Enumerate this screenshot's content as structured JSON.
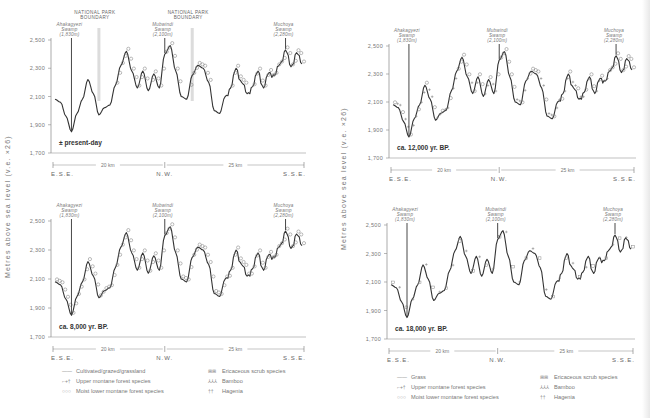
{
  "figure": {
    "y_axis_label": "Metres above sea level (v.e. ×26)",
    "y_ticks": [
      "2,500",
      "2,300",
      "2,100",
      "1,900",
      "1,700"
    ],
    "y_tick_values": [
      2500,
      2300,
      2100,
      1900,
      1700
    ],
    "direction_labels": {
      "start": "E.S.E.",
      "middle": "N.W.",
      "end": "S.S.E."
    },
    "distance_labels": {
      "first": "20 km",
      "second": "25 km"
    },
    "annotations": {
      "swamp1": [
        "Ahakagyezi",
        "Swamp",
        "(1,830m)"
      ],
      "swamp2": [
        "Mubwindi",
        "Swamp",
        "(2,100m)"
      ],
      "swamp3": [
        "Muchoya",
        "Swamp",
        "(2,280m)"
      ],
      "boundary": [
        "NATIONAL PARK",
        "BOUNDARY"
      ]
    },
    "legend_left": {
      "col1": [
        {
          "symbol": "——",
          "label": "Cultivated/grazed/grassland"
        },
        {
          "symbol": "⌐+†",
          "label": "Upper montane forest species"
        },
        {
          "symbol": "○○○",
          "label": "Moist lower montane forest species"
        }
      ],
      "col2": [
        {
          "symbol": "⊞⊞",
          "label": "Ericaceous scrub species"
        },
        {
          "symbol": "⅄⅄⅄",
          "label": "Bamboo"
        },
        {
          "symbol": "††",
          "label": "Hagenia"
        }
      ]
    },
    "legend_right": {
      "col1": [
        {
          "symbol": "——",
          "label": "Grass"
        },
        {
          "symbol": "⌐+†",
          "label": "Upper montane forest species"
        },
        {
          "symbol": "○○○",
          "label": "Moist lower montane forest species"
        }
      ],
      "col2": [
        {
          "symbol": "⊞⊞",
          "label": "Ericaceous scrub species"
        },
        {
          "symbol": "⅄⅄⅄",
          "label": "Bamboo"
        },
        {
          "symbol": "††",
          "label": "Hagenia"
        }
      ]
    }
  },
  "chart_data": [
    {
      "type": "line",
      "title": "± present-day",
      "xlabel": "Distance along transect (E.S.E. – N.W. – S.S.E.)",
      "ylabel": "Metres above sea level (v.e. ×26)",
      "ylim": [
        1700,
        2500
      ],
      "grid": false,
      "has_park_boundaries": true,
      "vegetation_symbols": "circles (moist lower montane forest) over upper slopes within park",
      "x_km": [
        0,
        1,
        2,
        3,
        4,
        5,
        6,
        7,
        8,
        9,
        10,
        11,
        12,
        13,
        14,
        15,
        16,
        17,
        18,
        19,
        20,
        21,
        22,
        23,
        24,
        25,
        26,
        27,
        28,
        29,
        30,
        31,
        32,
        33,
        34,
        35,
        36,
        37,
        38,
        39,
        40,
        41,
        42,
        43,
        44,
        45
      ],
      "elevation_m": [
        2080,
        2060,
        1960,
        1850,
        1980,
        2080,
        2220,
        2120,
        1970,
        2020,
        2040,
        2180,
        2320,
        2420,
        2280,
        2160,
        2280,
        2140,
        2260,
        2160,
        2400,
        2460,
        2280,
        2100,
        2080,
        2250,
        2320,
        2300,
        2200,
        2000,
        1980,
        2100,
        2160,
        2300,
        2200,
        2120,
        2170,
        2280,
        2160,
        2270,
        2250,
        2330,
        2430,
        2310,
        2410,
        2330
      ],
      "markers": [
        {
          "label": "Ahakagyezi Swamp (1,830m)",
          "x_km": 3
        },
        {
          "label": "Mubwindi Swamp (2,100m)",
          "x_km": 20
        },
        {
          "label": "Muchoya Swamp (2,280m)",
          "x_km": 42
        },
        {
          "label": "NATIONAL PARK BOUNDARY",
          "x_km": 8
        },
        {
          "label": "NATIONAL PARK BOUNDARY",
          "x_km": 25
        }
      ]
    },
    {
      "type": "line",
      "title": "ca. 12,000 yr. BP.",
      "ylim": [
        1700,
        2500
      ],
      "vegetation_symbols": "mixed upper montane (+) and moist lower montane (○) forest across profile",
      "x_km": [
        0,
        1,
        2,
        3,
        4,
        5,
        6,
        7,
        8,
        9,
        10,
        11,
        12,
        13,
        14,
        15,
        16,
        17,
        18,
        19,
        20,
        21,
        22,
        23,
        24,
        25,
        26,
        27,
        28,
        29,
        30,
        31,
        32,
        33,
        34,
        35,
        36,
        37,
        38,
        39,
        40,
        41,
        42,
        43,
        44,
        45
      ],
      "elevation_m": [
        2080,
        2060,
        1960,
        1850,
        1980,
        2080,
        2220,
        2120,
        1970,
        2020,
        2040,
        2180,
        2320,
        2420,
        2280,
        2160,
        2280,
        2140,
        2260,
        2160,
        2400,
        2460,
        2280,
        2100,
        2080,
        2250,
        2320,
        2300,
        2200,
        2000,
        1980,
        2100,
        2160,
        2300,
        2200,
        2120,
        2170,
        2280,
        2160,
        2270,
        2250,
        2330,
        2430,
        2310,
        2410,
        2330
      ],
      "markers": [
        {
          "label": "Ahakagyezi Swamp (1,830m)",
          "x_km": 3
        },
        {
          "label": "Mubwindi Swamp (2,100m)",
          "x_km": 20
        },
        {
          "label": "Muchoya Swamp (2,280m)",
          "x_km": 42
        }
      ]
    },
    {
      "type": "line",
      "title": "ca. 8,000 yr. BP.",
      "ylim": [
        1700,
        2500
      ],
      "vegetation_symbols": "moist lower montane forest (○) covering entire profile",
      "x_km": [
        0,
        1,
        2,
        3,
        4,
        5,
        6,
        7,
        8,
        9,
        10,
        11,
        12,
        13,
        14,
        15,
        16,
        17,
        18,
        19,
        20,
        21,
        22,
        23,
        24,
        25,
        26,
        27,
        28,
        29,
        30,
        31,
        32,
        33,
        34,
        35,
        36,
        37,
        38,
        39,
        40,
        41,
        42,
        43,
        44,
        45
      ],
      "elevation_m": [
        2080,
        2060,
        1960,
        1850,
        1980,
        2080,
        2220,
        2120,
        1970,
        2020,
        2040,
        2180,
        2320,
        2420,
        2280,
        2160,
        2280,
        2140,
        2260,
        2160,
        2400,
        2460,
        2280,
        2100,
        2080,
        2250,
        2320,
        2300,
        2200,
        2000,
        1980,
        2100,
        2160,
        2300,
        2200,
        2120,
        2170,
        2280,
        2160,
        2270,
        2250,
        2330,
        2430,
        2310,
        2410,
        2330
      ],
      "markers": [
        {
          "label": "Ahakagyezi Swamp (1,830m)",
          "x_km": 3
        },
        {
          "label": "Mubwindi Swamp (2,100m)",
          "x_km": 20
        },
        {
          "label": "Muchoya Swamp (2,280m)",
          "x_km": 42
        }
      ]
    },
    {
      "type": "line",
      "title": "ca. 18,000 yr. BP.",
      "ylim": [
        1700,
        2500
      ],
      "vegetation_symbols": "sparse ericaceous scrub / grass with scattered symbols",
      "x_km": [
        0,
        1,
        2,
        3,
        4,
        5,
        6,
        7,
        8,
        9,
        10,
        11,
        12,
        13,
        14,
        15,
        16,
        17,
        18,
        19,
        20,
        21,
        22,
        23,
        24,
        25,
        26,
        27,
        28,
        29,
        30,
        31,
        32,
        33,
        34,
        35,
        36,
        37,
        38,
        39,
        40,
        41,
        42,
        43,
        44,
        45
      ],
      "elevation_m": [
        2080,
        2060,
        1960,
        1850,
        1980,
        2080,
        2220,
        2120,
        1970,
        2020,
        2040,
        2180,
        2320,
        2420,
        2280,
        2160,
        2280,
        2140,
        2260,
        2160,
        2400,
        2460,
        2280,
        2100,
        2080,
        2250,
        2320,
        2300,
        2200,
        2000,
        1980,
        2100,
        2160,
        2300,
        2200,
        2120,
        2170,
        2280,
        2160,
        2270,
        2250,
        2330,
        2430,
        2310,
        2410,
        2330
      ],
      "markers": [
        {
          "label": "Ahakagyezi Swamp (1,830m)",
          "x_km": 3
        },
        {
          "label": "Mubwindi Swamp (2,100m)",
          "x_km": 20
        },
        {
          "label": "Muchoya Swamp (2,280m)",
          "x_km": 42
        }
      ]
    }
  ],
  "panels": [
    {
      "id": "present",
      "period_label": "± present-day",
      "x": 51,
      "y": 40,
      "w": 255,
      "h": 113,
      "symbol": "circle",
      "boundaries": true
    },
    {
      "id": "12000",
      "period_label": "ca. 12,000 yr. BP.",
      "x": 389,
      "y": 46,
      "w": 247,
      "h": 112,
      "symbol": "mixed",
      "boundaries": false
    },
    {
      "id": "8000",
      "period_label": "ca. 8,000 yr. BP.",
      "x": 51,
      "y": 221,
      "w": 255,
      "h": 116,
      "symbol": "circle-dense",
      "boundaries": false
    },
    {
      "id": "18000",
      "period_label": "ca. 18,000 yr. BP.",
      "x": 387,
      "y": 225,
      "w": 248,
      "h": 114,
      "symbol": "sparse",
      "boundaries": false
    }
  ]
}
